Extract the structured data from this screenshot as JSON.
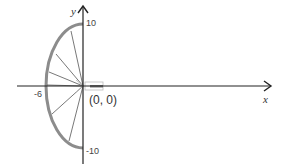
{
  "diagram": {
    "type": "coordinate-plane-half-ellipse",
    "axes": {
      "x_label": "x",
      "y_label": "y"
    },
    "ticks": {
      "y_top": "10",
      "y_bottom": "-10",
      "x_left": "-6"
    },
    "origin_label": "(0, 0)",
    "shape": {
      "kind": "left half-ellipse",
      "semi_axis_x": 6,
      "semi_axis_y": 10,
      "radial_lines": 6
    },
    "colors": {
      "axis": "#222222",
      "arc": "#8c8c8c",
      "radial": "#555555",
      "marker": "#bbbbbb",
      "marker_fill": "#777777"
    }
  }
}
